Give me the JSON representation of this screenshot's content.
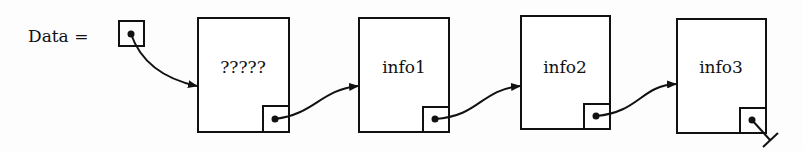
{
  "diagram": {
    "type": "linked-list",
    "head_label": "Data =",
    "nodes": [
      {
        "info": "?????"
      },
      {
        "info": "info1"
      },
      {
        "info": "info2"
      },
      {
        "info": "info3"
      }
    ],
    "terminator": "null-ground-symbol"
  }
}
